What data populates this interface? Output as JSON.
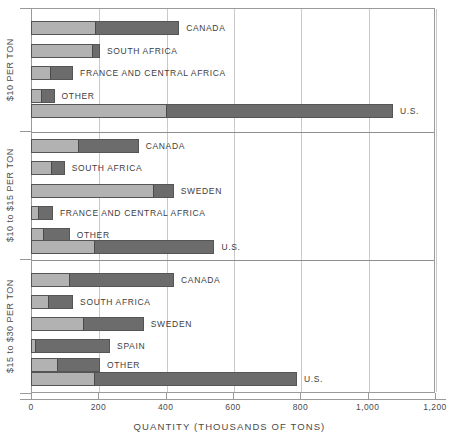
{
  "chart_data": {
    "type": "bar",
    "orientation": "horizontal",
    "subtype": "stacked-grouped",
    "title": "",
    "xlabel": "QUANTITY (THOUSANDS OF TONS)",
    "ylabel": "",
    "xlim": [
      0,
      1200
    ],
    "xticks": [
      0,
      200,
      400,
      600,
      800,
      1000,
      1200
    ],
    "xtick_labels": [
      "0",
      "200",
      "400",
      "600",
      "800",
      "1,000",
      "1,200"
    ],
    "grid": true,
    "legend": null,
    "segment_names": [
      "lower",
      "upper"
    ],
    "groups": [
      {
        "label": "$10 PER TON",
        "bars": [
          {
            "label": "CANADA",
            "segments": [
              190,
              250
            ],
            "total": 440
          },
          {
            "label": "SOUTH AFRICA",
            "segments": [
              185,
              20
            ],
            "total": 205
          },
          {
            "label": "FRANCE AND CENTRAL AFRICA",
            "segments": [
              55,
              70
            ],
            "total": 125
          },
          {
            "label": "OTHER",
            "segments": [
              30,
              40
            ],
            "total": 70
          },
          {
            "label": "U.S.",
            "segments": [
              400,
              675
            ],
            "total": 1075
          }
        ]
      },
      {
        "label": "$10 to $15 PER TON",
        "bars": [
          {
            "label": "CANADA",
            "segments": [
              140,
              180
            ],
            "total": 320
          },
          {
            "label": "SOUTH AFRICA",
            "segments": [
              60,
              40
            ],
            "total": 100
          },
          {
            "label": "SWEDEN",
            "segments": [
              364,
              60
            ],
            "total": 424
          },
          {
            "label": "FRANCE AND CENTRAL AFRICA",
            "segments": [
              20,
              45
            ],
            "total": 65
          },
          {
            "label": "OTHER",
            "segments": [
              35,
              80
            ],
            "total": 115
          },
          {
            "label": "U.S.",
            "segments": [
              185,
              360
            ],
            "total": 545
          }
        ]
      },
      {
        "label": "$15 to $30 PER TON",
        "bars": [
          {
            "label": "CANADA",
            "segments": [
              110,
              315
            ],
            "total": 425
          },
          {
            "label": "SOUTH AFRICA",
            "segments": [
              50,
              75
            ],
            "total": 125
          },
          {
            "label": "SWEDEN",
            "segments": [
              155,
              180
            ],
            "total": 335
          },
          {
            "label": "SPAIN",
            "segments": [
              10,
              225
            ],
            "total": 235
          },
          {
            "label": "OTHER",
            "segments": [
              75,
              130
            ],
            "total": 205
          },
          {
            "label": "U.S.",
            "segments": [
              185,
              605
            ],
            "total": 790
          }
        ]
      }
    ]
  },
  "colors": {
    "segment_light": "#b2b2b2",
    "segment_dark": "#6c6c6c",
    "bar_outline": "#555555",
    "gridline": "#c9c9c9",
    "frame": "#9a9a9a",
    "text": "#4a4a4a",
    "background": "#ffffff"
  }
}
